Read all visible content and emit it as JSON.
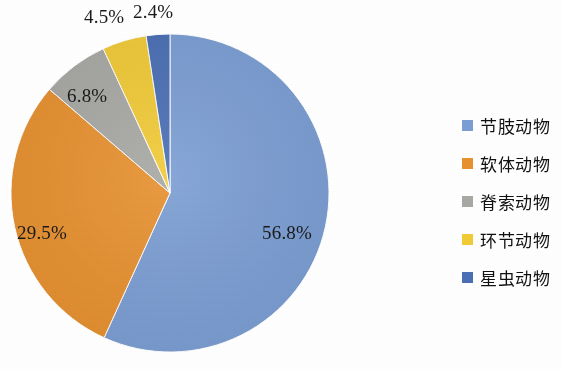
{
  "chart_data": {
    "type": "pie",
    "title": "",
    "subtitle": "",
    "xlabel": "",
    "ylabel": "",
    "grid": false,
    "legend_position": "right",
    "categories": [
      "节肢动物",
      "软体动物",
      "脊索动物",
      "环节动物",
      "星虫动物"
    ],
    "values": [
      56.8,
      29.5,
      6.8,
      4.5,
      2.4
    ],
    "value_labels": [
      "56.8%",
      "29.5%",
      "6.8%",
      "4.5%",
      "2.4%"
    ],
    "colors": [
      "#7b9ed4",
      "#e8912f",
      "#a8a8a4",
      "#f2cb36",
      "#4a6fb5"
    ],
    "start_angle_deg": 0,
    "direction": "clockwise",
    "units": "percent"
  },
  "pie": {
    "slices": [
      {
        "label": "节肢动物",
        "percent": 56.8,
        "display": "56.8%",
        "color": "#7b9ed4"
      },
      {
        "label": "软体动物",
        "percent": 29.5,
        "display": "29.5%",
        "color": "#e8912f"
      },
      {
        "label": "脊索动物",
        "percent": 6.8,
        "display": "6.8%",
        "color": "#a8a8a4"
      },
      {
        "label": "环节动物",
        "percent": 4.5,
        "display": "4.5%",
        "color": "#f2cb36"
      },
      {
        "label": "星虫动物",
        "percent": 2.4,
        "display": "2.4%",
        "color": "#4a6fb5"
      }
    ]
  },
  "labels": {
    "blue": "56.8%",
    "orange": "29.5%",
    "gray": "6.8%",
    "yellow": "4.5%",
    "navy": "2.4%"
  },
  "legend": {
    "items": [
      {
        "label": "节肢动物",
        "color": "#7b9ed4"
      },
      {
        "label": "软体动物",
        "color": "#e8912f"
      },
      {
        "label": "脊索动物",
        "color": "#a8a8a4"
      },
      {
        "label": "环节动物",
        "color": "#f2cb36"
      },
      {
        "label": "星虫动物",
        "color": "#4a6fb5"
      }
    ]
  }
}
